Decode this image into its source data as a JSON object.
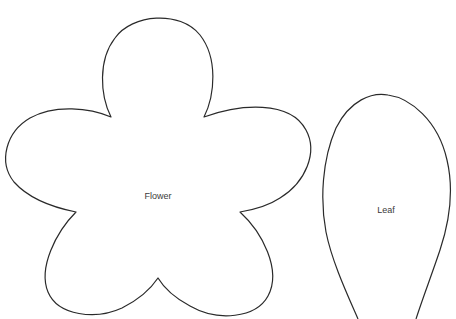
{
  "diagram": {
    "type": "craft-template",
    "shapes": [
      {
        "id": "flower",
        "label": "Flower",
        "kind": "five-petal flower outline",
        "label_pos": [
          158,
          196
        ]
      },
      {
        "id": "leaf",
        "label": "Leaf",
        "kind": "teardrop leaf outline",
        "label_pos": [
          386,
          210
        ]
      }
    ],
    "colors": {
      "stroke": "#2a2a2a",
      "fill": "#ffffff",
      "label": "#3a3a3a",
      "background": "#ffffff"
    }
  }
}
